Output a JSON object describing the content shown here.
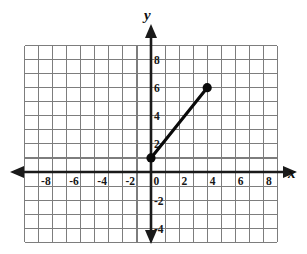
{
  "figure": {
    "title": "",
    "axis_labels": {
      "x": "x",
      "y": "y"
    }
  },
  "chart_data": {
    "type": "line",
    "title": "",
    "xlabel": "x",
    "ylabel": "y",
    "xlim": [
      -9,
      9
    ],
    "ylim": [
      -5,
      9
    ],
    "grid": true,
    "grid_step": 1,
    "legend": "none",
    "x_tick_labels": [
      "-8",
      "-6",
      "-4",
      "-2",
      "0",
      "2",
      "4",
      "6",
      "8"
    ],
    "x_tick_values": [
      -8,
      -6,
      -4,
      -2,
      0,
      2,
      4,
      6,
      8
    ],
    "y_tick_labels": [
      "8",
      "6",
      "4",
      "2",
      "-2",
      "-4"
    ],
    "y_tick_values": [
      8,
      6,
      4,
      2,
      -2,
      -4
    ],
    "origin_label": "0",
    "series": [
      {
        "name": "segment",
        "type": "segment",
        "marker": "filled-circle",
        "x": [
          0,
          4
        ],
        "y": [
          1,
          6
        ],
        "points": [
          {
            "label": "lower-endpoint",
            "x": 0,
            "y": 1
          },
          {
            "label": "upper-endpoint",
            "x": 4,
            "y": 6
          }
        ]
      }
    ]
  },
  "colors": {
    "grid": "#7d7d7d",
    "axis": "#1a1a1a",
    "segment": "#0a0a0a",
    "background": "#ffffff",
    "text": "#161616"
  }
}
